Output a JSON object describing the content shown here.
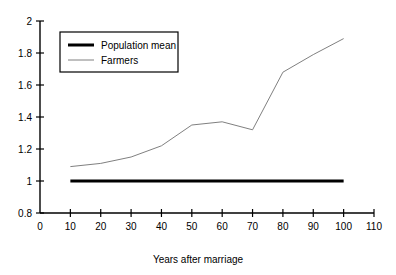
{
  "chart_data": {
    "type": "line",
    "title": "",
    "xlabel": "Years after marriage",
    "ylabel": "",
    "xlim": [
      0,
      110
    ],
    "ylim": [
      0.8,
      2
    ],
    "xticks": [
      "0",
      "10",
      "20",
      "30",
      "40",
      "50",
      "60",
      "70",
      "80",
      "90",
      "100",
      "110"
    ],
    "yticks": [
      "0.8",
      "1",
      "1.2",
      "1.4",
      "1.6",
      "1.8",
      "2"
    ],
    "grid": false,
    "legend_position": "upper-left",
    "x": [
      10,
      20,
      30,
      40,
      50,
      60,
      70,
      80,
      90,
      100
    ],
    "series": [
      {
        "name": "Population mean",
        "color": "#000000",
        "line_width": 3,
        "values": [
          1,
          1,
          1,
          1,
          1,
          1,
          1,
          1,
          1,
          1
        ]
      },
      {
        "name": "Farmers",
        "color": "#808080",
        "line_width": 1,
        "values": [
          1.09,
          1.11,
          1.15,
          1.22,
          1.35,
          1.37,
          1.32,
          1.68,
          1.79,
          1.89
        ]
      }
    ]
  },
  "legend": {
    "entries": [
      {
        "label": "Population mean"
      },
      {
        "label": "Farmers"
      }
    ]
  },
  "axis": {
    "x_title": "Years after marriage"
  },
  "colors": {
    "axis": "#000000",
    "background": "#ffffff",
    "population_mean": "#000000",
    "farmers": "#808080"
  }
}
